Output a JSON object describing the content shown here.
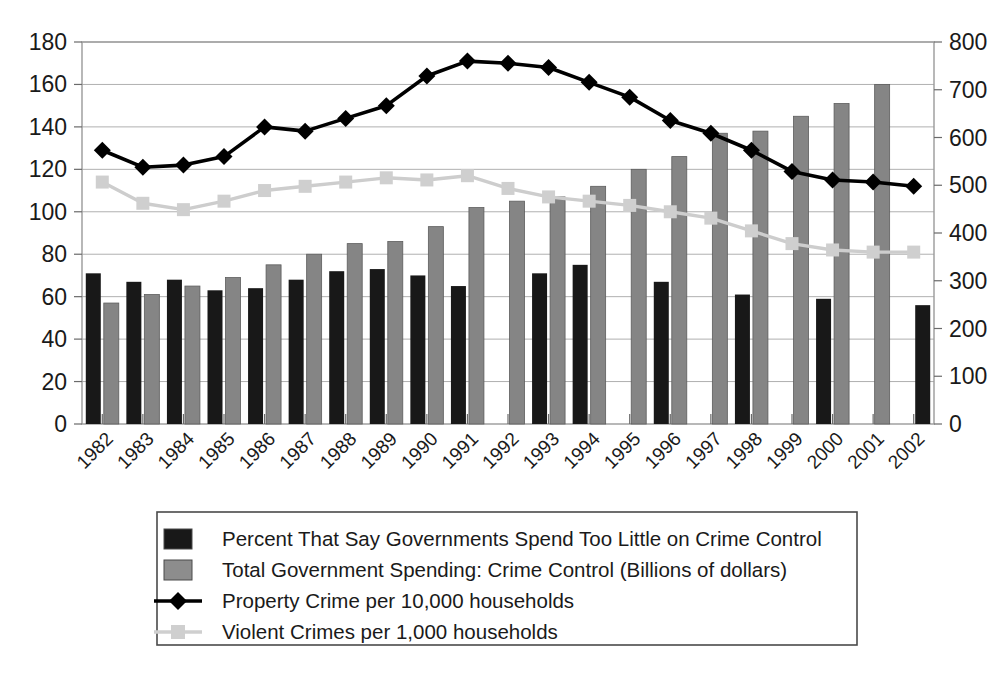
{
  "chart_data": {
    "type": "bar",
    "title": "",
    "subtitle": "",
    "xlabel": "",
    "ylabel": "",
    "ylabel_right": "",
    "grid": true,
    "legend_position": "bottom",
    "categories": [
      "1982",
      "1983",
      "1984",
      "1985",
      "1986",
      "1987",
      "1988",
      "1989",
      "1990",
      "1991",
      "1992",
      "1993",
      "1994",
      "1995",
      "1996",
      "1997",
      "1998",
      "1999",
      "2000",
      "2001",
      "2002"
    ],
    "ylim": [
      0,
      180
    ],
    "ytick_labels": [
      "0",
      "20",
      "40",
      "60",
      "80",
      "100",
      "120",
      "140",
      "160",
      "180"
    ],
    "ylim_right": [
      0,
      800
    ],
    "ytick_labels_right": [
      "0",
      "100",
      "200",
      "300",
      "400",
      "500",
      "600",
      "700",
      "800"
    ],
    "series": [
      {
        "name": "Percent That Say Governments Spend Too Little on Crime Control",
        "type": "bar",
        "axis": "left",
        "color": "#181818",
        "values": [
          71,
          67,
          68,
          63,
          64,
          68,
          72,
          73,
          70,
          65,
          null,
          71,
          75,
          null,
          67,
          null,
          61,
          null,
          59,
          null,
          56
        ]
      },
      {
        "name": "Total Government Spending: Crime Control (Billions of dollars)",
        "type": "bar",
        "axis": "right",
        "color": "#858585",
        "values": [
          57,
          61,
          65,
          69,
          75,
          80,
          85,
          86,
          93,
          102,
          105,
          107,
          112,
          120,
          126,
          137,
          138,
          145,
          151,
          160,
          null
        ],
        "values_right_axis": [
          253,
          271,
          289,
          307,
          333,
          356,
          378,
          382,
          413,
          453,
          467,
          476,
          498,
          533,
          560,
          609,
          613,
          644,
          671,
          711,
          null
        ]
      },
      {
        "name": "Property Crime per 10,000 households",
        "type": "line",
        "axis": "left",
        "color": "#000000",
        "values": [
          129,
          121,
          122,
          126,
          140,
          138,
          144,
          150,
          164,
          171,
          170,
          168,
          161,
          154,
          143,
          137,
          129,
          119,
          115,
          114,
          112
        ]
      },
      {
        "name": "Violent Crimes per 1,000 households",
        "type": "line",
        "axis": "left",
        "color": "#cfcfcf",
        "values": [
          114,
          104,
          101,
          105,
          110,
          112,
          114,
          116,
          115,
          117,
          111,
          107,
          105,
          103,
          100,
          97,
          91,
          85,
          82,
          81,
          81
        ]
      }
    ],
    "legend_entries": [
      {
        "label": "Percent That Say Governments Spend Too Little on Crime Control",
        "marker": "square",
        "color": "#181818"
      },
      {
        "label": "Total Government Spending: Crime Control (Billions of dollars)",
        "marker": "square",
        "color": "#8d8d8d"
      },
      {
        "label": "Property Crime per 10,000 households",
        "marker": "line-diamond",
        "color": "#000000"
      },
      {
        "label": "Violent Crimes per 1,000 households",
        "marker": "line-square",
        "color": "#cfcfcf"
      }
    ]
  }
}
